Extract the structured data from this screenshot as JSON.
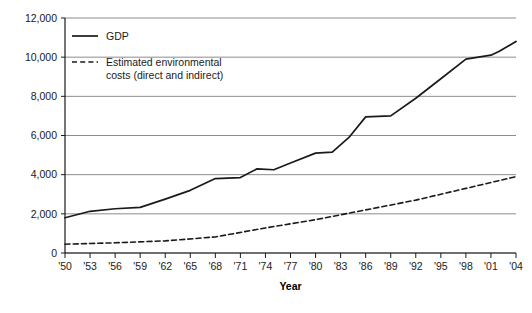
{
  "chart_data": {
    "type": "line",
    "title": "",
    "xlabel": "Year",
    "ylabel": "",
    "grid": true,
    "legend_position": "inside-top-left",
    "xlim": [
      1950,
      2004
    ],
    "ylim": [
      0,
      12000
    ],
    "ytick_labels": [
      "12,000",
      "10,000",
      "8,000",
      "6,000",
      "4,000",
      "2,000",
      "0"
    ],
    "ytick_values": [
      12000,
      10000,
      8000,
      6000,
      4000,
      2000,
      0
    ],
    "xtick_labels": [
      "'50",
      "'53",
      "'56",
      "'59",
      "'62",
      "'65",
      "'68",
      "'71",
      "'74",
      "'77",
      "'80",
      "'83",
      "'86",
      "'89",
      "'92",
      "'95",
      "'98",
      "'01",
      "'04"
    ],
    "xtick_values": [
      1950,
      1953,
      1956,
      1959,
      1962,
      1965,
      1968,
      1971,
      1974,
      1977,
      1980,
      1983,
      1986,
      1989,
      1992,
      1995,
      1998,
      2001,
      2004
    ],
    "series": [
      {
        "name": "GDP",
        "style": "solid",
        "color": "#1a1a1a",
        "x": [
          1950,
          1953,
          1956,
          1959,
          1962,
          1965,
          1968,
          1971,
          1973,
          1975,
          1977,
          1980,
          1982,
          1984,
          1986,
          1989,
          1992,
          1995,
          1998,
          2001,
          2002,
          2004
        ],
        "values": [
          1800,
          2130,
          2260,
          2330,
          2750,
          3200,
          3800,
          3850,
          4300,
          4250,
          4600,
          5100,
          5150,
          5900,
          6950,
          7000,
          7900,
          8900,
          9900,
          10100,
          10300,
          10800
        ]
      },
      {
        "name": "Estimated environmental costs (direct and indirect)",
        "style": "dashed",
        "color": "#1a1a1a",
        "x": [
          1950,
          1956,
          1962,
          1968,
          1974,
          1980,
          1986,
          1992,
          1998,
          2004
        ],
        "values": [
          450,
          520,
          620,
          820,
          1280,
          1700,
          2200,
          2700,
          3300,
          3900
        ]
      }
    ]
  },
  "legend": {
    "items": [
      {
        "label": "GDP",
        "style": "solid"
      },
      {
        "label": "Estimated environmental",
        "label2": "costs (direct and indirect)",
        "style": "dashed"
      }
    ]
  },
  "caption": {
    "text": ""
  }
}
